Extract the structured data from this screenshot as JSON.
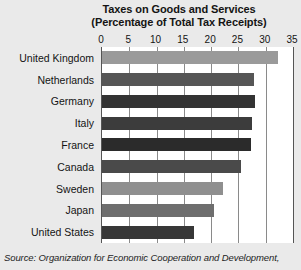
{
  "chart_data": {
    "type": "bar",
    "orientation": "horizontal",
    "title": "Taxes on Goods and Services",
    "subtitle": "(Percentage of Total Tax Receipts)",
    "xlabel": "",
    "ylabel": "",
    "xlim": [
      0,
      35
    ],
    "xticks": [
      0,
      5,
      10,
      15,
      20,
      25,
      30,
      35
    ],
    "grid": true,
    "legend": false,
    "categories": [
      "United Kingdom",
      "Netherlands",
      "Germany",
      "Italy",
      "France",
      "Canada",
      "Sweden",
      "Japan",
      "United States"
    ],
    "values": [
      32.3,
      27.8,
      28.0,
      27.5,
      27.3,
      25.5,
      22.2,
      20.5,
      16.8
    ],
    "bar_colors": [
      "#9a9a9a",
      "#565656",
      "#333333",
      "#3c3c3c",
      "#2b2b2b",
      "#4a4a4a",
      "#8f8f8f",
      "#6e6e6e",
      "#373737"
    ],
    "source": "Source: Organization for Economic Cooperation and Development,",
    "background_color": "#eaeaea",
    "plot_background_color": "#ffffff",
    "gridline_color": "#8a8a8a"
  }
}
